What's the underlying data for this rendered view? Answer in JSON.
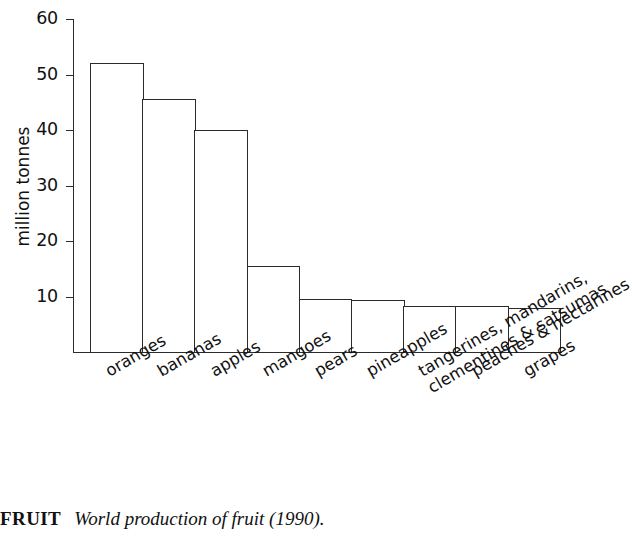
{
  "chart_data": {
    "type": "bar",
    "title": "",
    "xlabel": "",
    "ylabel": "million tonnes",
    "ylim": [
      0,
      60
    ],
    "yticks": [
      10,
      20,
      30,
      40,
      50,
      60
    ],
    "grid": false,
    "legend": null,
    "categories": [
      "oranges",
      "bananas",
      "apples",
      "mangoes",
      "pears",
      "pineapples",
      "tangerines, mandarins,\nclementines & satsumas",
      "peaches & nectarines",
      "grapes"
    ],
    "values": [
      52,
      45.5,
      40,
      15.5,
      9.5,
      9.3,
      8.3,
      8.2,
      8
    ]
  },
  "axis": {
    "y_title": "million tonnes",
    "tick_labels": [
      "60",
      "50",
      "40",
      "30",
      "20",
      "10"
    ]
  },
  "caption": {
    "keyword": "FRUIT",
    "text": "World production of fruit (1990)."
  },
  "colors": {
    "ink": "#2b2b2b",
    "bar_fill": "#ffffff",
    "background": "#ffffff"
  }
}
